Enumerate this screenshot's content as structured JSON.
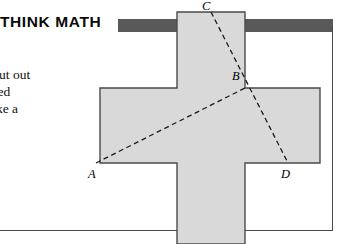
{
  "header": {
    "title": "THINK MATH",
    "rule_text": "",
    "rule_color": "#595959"
  },
  "caption": {
    "lines": [
      "Cut out",
      "tted",
      "ake a"
    ]
  },
  "figure": {
    "name": "greek-cross-with-dashed-lines",
    "fill_color": "#d9d9d9",
    "stroke_color": "#4a4a4a",
    "dash_color": "#1a1a1a",
    "cross": {
      "description": "Greek cross (plus shape) shaded light gray",
      "left": 100,
      "right": 320,
      "top": 12,
      "bottom": 244,
      "arm_left_x": 100,
      "arm_right_x": 320,
      "stem_left_x": 177,
      "stem_right_x": 245,
      "arm_top_y": 88,
      "arm_bottom_y": 163
    },
    "points": [
      {
        "label": "A",
        "x": 96,
        "y": 163
      },
      {
        "label": "B",
        "x": 245,
        "y": 88
      },
      {
        "label": "C",
        "x": 211,
        "y": 12
      },
      {
        "label": "D",
        "x": 288,
        "y": 163
      }
    ],
    "segments": [
      {
        "name": "segment-AB",
        "from": "A",
        "to": "B",
        "style": "dashed"
      },
      {
        "name": "segment-CD",
        "from": "C",
        "to": "D",
        "style": "dashed"
      }
    ]
  }
}
